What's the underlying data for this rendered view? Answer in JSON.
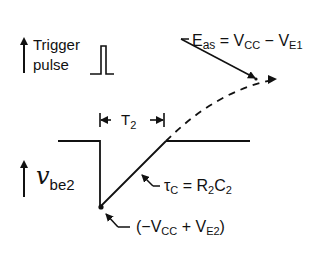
{
  "diagram": {
    "trigger_label_line1": "Trigger",
    "trigger_label_line2": "pulse",
    "vbe_symbol": "v",
    "vbe_subscript": "be2",
    "t2_label": "T",
    "t2_subscript": "2",
    "eas_label": {
      "E": "E",
      "E_sub": "as",
      "eq": " = V",
      "cc_sub": "CC",
      "minus": " − V",
      "e1_sub": "E1"
    },
    "tau_label": {
      "tau": "τ",
      "tau_sub": "C",
      "eq": " = R",
      "r_sub": "2",
      "c": "C",
      "c_sub": "2"
    },
    "min_label": {
      "open": "(−V",
      "cc_sub": "CC",
      "plus": " + V",
      "e2_sub": "E2",
      "close": ")"
    },
    "colors": {
      "ink": "#111111",
      "background": "#ffffff"
    }
  }
}
